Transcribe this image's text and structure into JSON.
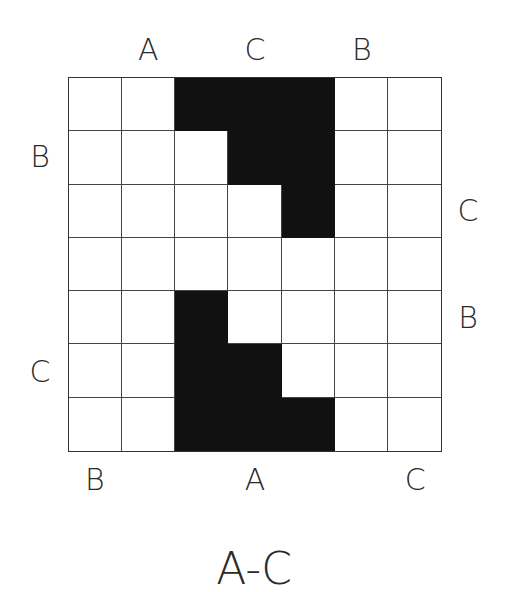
{
  "puzzle": {
    "title": "A-C",
    "size": 7,
    "letters": [
      "A",
      "B",
      "C"
    ],
    "grid": [
      [
        0,
        0,
        1,
        1,
        1,
        0,
        0
      ],
      [
        0,
        0,
        0,
        1,
        1,
        0,
        0
      ],
      [
        0,
        0,
        0,
        0,
        1,
        0,
        0
      ],
      [
        0,
        0,
        0,
        0,
        0,
        0,
        0
      ],
      [
        0,
        0,
        1,
        0,
        0,
        0,
        0
      ],
      [
        0,
        0,
        1,
        1,
        0,
        0,
        0
      ],
      [
        0,
        0,
        1,
        1,
        1,
        0,
        0
      ]
    ],
    "clues": {
      "top": [
        null,
        "A",
        null,
        "C",
        null,
        "B",
        null
      ],
      "bottom": [
        "B",
        null,
        null,
        "A",
        null,
        null,
        "C"
      ],
      "left": [
        null,
        "B",
        null,
        null,
        null,
        "C",
        null
      ],
      "right": [
        null,
        null,
        "C",
        null,
        "B",
        null,
        null
      ]
    },
    "colors": {
      "filled": "#111111",
      "empty": "#ffffff",
      "line": "#444444",
      "text": "#2a2a2a"
    }
  }
}
